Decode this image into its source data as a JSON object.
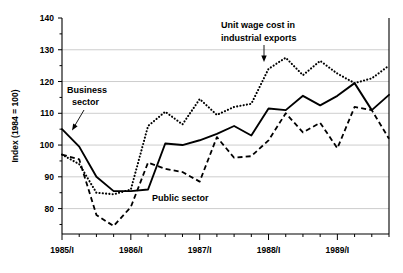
{
  "chart_data": {
    "type": "line",
    "title": "",
    "xlabel": "",
    "ylabel": "Index (1984 = 100)",
    "ylim": [
      72,
      140
    ],
    "yticks": [
      80,
      90,
      100,
      110,
      120,
      130,
      140
    ],
    "ytick_labels": [
      "80",
      "90",
      "100",
      "110",
      "120",
      "130",
      "140"
    ],
    "minor_ticks": true,
    "grid": true,
    "legend_position": "inline-annotations",
    "x": [
      "1985/I",
      "1985/II",
      "1985/III",
      "1985/IV",
      "1986/I",
      "1986/II",
      "1986/III",
      "1986/IV",
      "1987/I",
      "1987/II",
      "1987/III",
      "1987/IV",
      "1988/I",
      "1988/II",
      "1988/III",
      "1988/IV",
      "1989/I",
      "1989/II",
      "1989/III",
      "1989/IV"
    ],
    "xtick_labels": [
      "1985/I",
      "1986/I",
      "1987/I",
      "1988/I",
      "1989/I"
    ],
    "xtick_positions": [
      0,
      4,
      8,
      12,
      16
    ],
    "series": [
      {
        "name": "Business sector",
        "style": "solid",
        "values": [
          105.0,
          99.5,
          90.0,
          85.5,
          85.5,
          86.0,
          100.5,
          100.0,
          101.5,
          103.5,
          106.0,
          103.0,
          111.5,
          111.0,
          115.5,
          112.5,
          115.5,
          119.5,
          111.0,
          115.8
        ]
      },
      {
        "name": "Unit wage cost in industrial exports",
        "style": "dotted",
        "values": [
          97.0,
          94.0,
          85.0,
          84.5,
          86.0,
          106.0,
          110.5,
          106.5,
          114.5,
          109.5,
          112.0,
          113.0,
          124.0,
          127.5,
          122.0,
          126.5,
          122.5,
          119.5,
          121.0,
          125.0
        ]
      },
      {
        "name": "Public sector",
        "style": "dashed",
        "values": [
          97.0,
          95.5,
          78.0,
          74.5,
          80.5,
          94.5,
          92.5,
          91.5,
          88.5,
          102.5,
          96.0,
          96.5,
          101.5,
          110.0,
          104.0,
          107.0,
          99.0,
          112.0,
          111.0,
          102.0
        ]
      }
    ],
    "annotations": [
      {
        "name": "unit-wage-cost-label",
        "text_lines": [
          "Unit wage cost in",
          "industrial exports"
        ],
        "arrow": "down"
      },
      {
        "name": "business-sector-label",
        "text_lines": [
          "Business",
          "sector"
        ],
        "arrow": "down-left"
      },
      {
        "name": "public-sector-label",
        "text_lines": [
          "Public sector"
        ],
        "arrow": "none"
      }
    ]
  }
}
